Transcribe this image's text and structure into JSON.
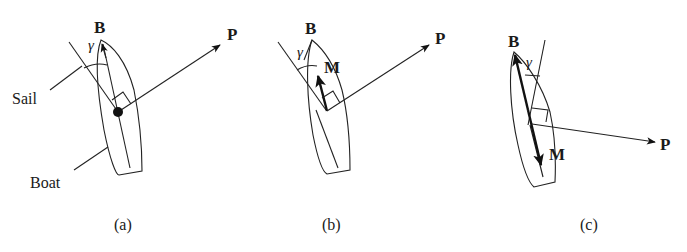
{
  "figure": {
    "panels": [
      {
        "id": "a",
        "caption": "(a)",
        "labels": {
          "bow": "B",
          "angle": "γ",
          "force": "P",
          "sail": "Sail",
          "boat": "Boat"
        }
      },
      {
        "id": "b",
        "caption": "(b)",
        "labels": {
          "bow": "B",
          "angle": "γ",
          "force": "P",
          "moment": "M"
        }
      },
      {
        "id": "c",
        "caption": "(c)",
        "labels": {
          "bow": "B",
          "angle": "γ",
          "force": "P",
          "moment": "M"
        }
      }
    ],
    "colors": {
      "ink": "#222222",
      "background": "#ffffff"
    }
  }
}
